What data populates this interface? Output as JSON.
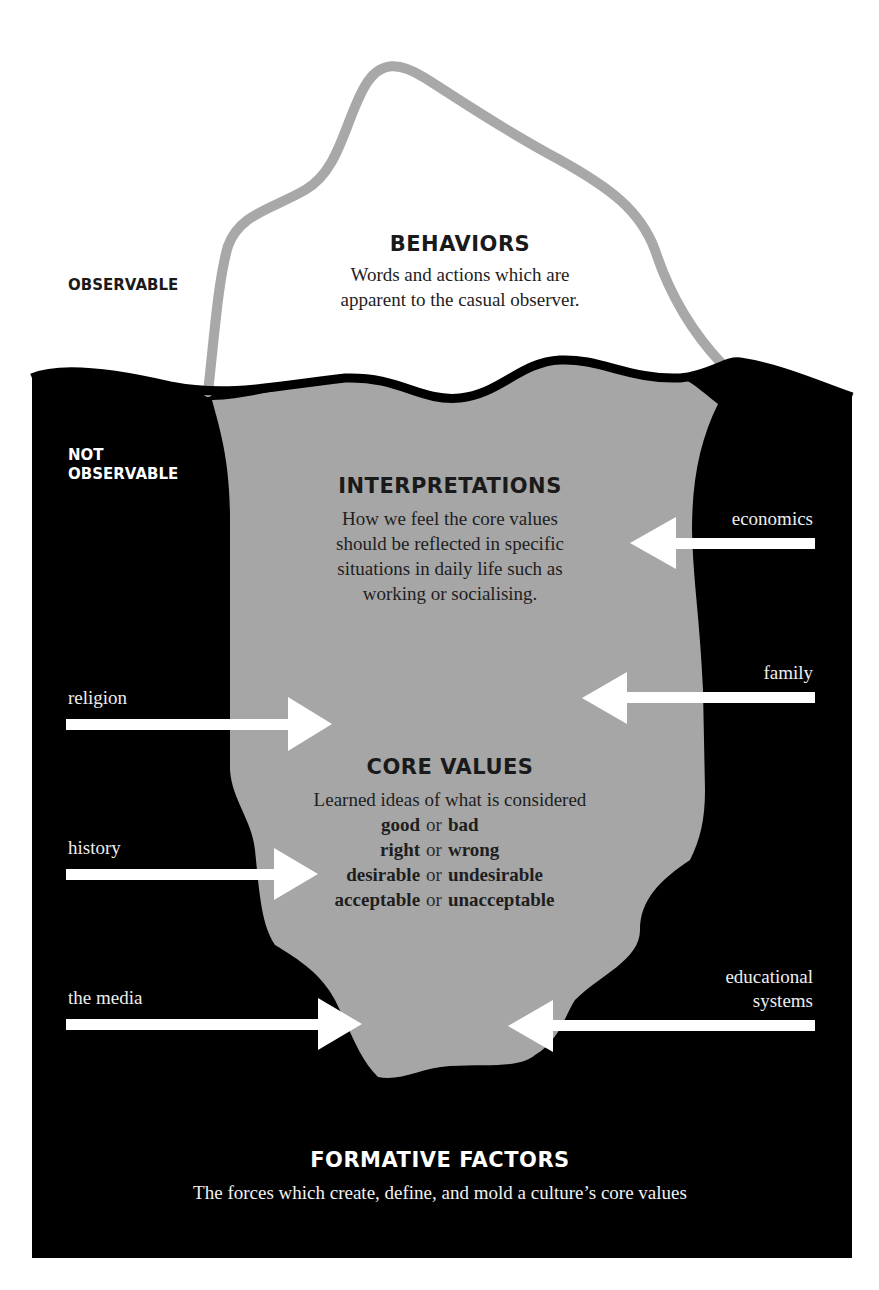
{
  "colors": {
    "water": "#000000",
    "ice_underwater": "#a6a6a6",
    "ice_outline": "#a8a8a8",
    "above_water_fill": "#ffffff",
    "arrow": "#ffffff",
    "dark_text": "#1a1a1a",
    "light_text": "#ffffff"
  },
  "zones": {
    "observable": "OBSERVABLE",
    "not_observable_line1": "NOT",
    "not_observable_line2": "OBSERVABLE"
  },
  "behaviors": {
    "title": "BEHAVIORS",
    "line1": "Words and actions which are",
    "line2": "apparent to the casual observer."
  },
  "interpretations": {
    "title": "INTERPRETATIONS",
    "line1": "How we feel the core values",
    "line2": "should be reflected in specific",
    "line3": "situations in daily life such as",
    "line4": "working or socialising."
  },
  "core_values": {
    "title": "CORE VALUES",
    "intro": "Learned ideas of what is considered",
    "conjunction": "or",
    "pairs": [
      {
        "a": "good",
        "b": "bad"
      },
      {
        "a": "right",
        "b": "wrong"
      },
      {
        "a": "desirable",
        "b": "undesirable"
      },
      {
        "a": "acceptable",
        "b": "unacceptable"
      }
    ]
  },
  "factors": {
    "left": [
      {
        "label": "religion",
        "direction": "right"
      },
      {
        "label": "history",
        "direction": "right"
      },
      {
        "label": "the media",
        "direction": "right"
      }
    ],
    "right": [
      {
        "label": "economics",
        "direction": "left"
      },
      {
        "label": "family",
        "direction": "left"
      },
      {
        "label_line1": "educational",
        "label_line2": "systems",
        "direction": "left"
      }
    ]
  },
  "formative_factors": {
    "title": "FORMATIVE FACTORS",
    "description": "The forces which create, define, and mold a culture’s core values"
  }
}
